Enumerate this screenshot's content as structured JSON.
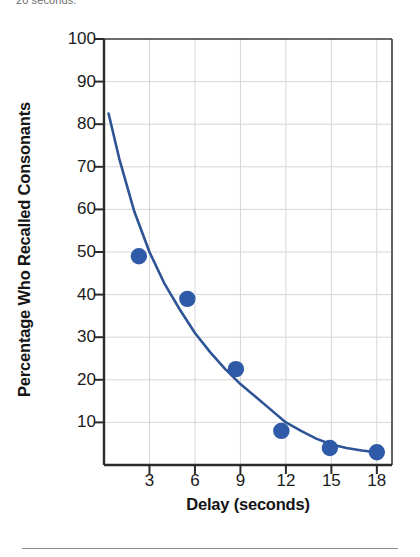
{
  "caption": {
    "text": "20 seconds."
  },
  "chart_data": {
    "type": "scatter",
    "title": "",
    "xlabel": "Delay (seconds)",
    "ylabel": "Percentage Who Recalled Consonants",
    "xlim": [
      0,
      19
    ],
    "ylim": [
      0,
      100
    ],
    "xticks": [
      "3",
      "6",
      "9",
      "12",
      "15",
      "18"
    ],
    "xtick_values": [
      3,
      6,
      9,
      12,
      15,
      18
    ],
    "yticks": [
      "10",
      "20",
      "30",
      "40",
      "50",
      "60",
      "70",
      "80",
      "90",
      "100"
    ],
    "ytick_values": [
      10,
      20,
      30,
      40,
      50,
      60,
      70,
      80,
      90,
      100
    ],
    "grid": true,
    "legend": "none",
    "marker_color": "#2e5aa8",
    "line_color": "#2f5496",
    "grid_color": "#d6d6d6",
    "axis_color": "#3a3a3a",
    "points": [
      {
        "x": 2.3,
        "y": 49.0
      },
      {
        "x": 5.5,
        "y": 39.0
      },
      {
        "x": 8.7,
        "y": 22.5
      },
      {
        "x": 11.7,
        "y": 8.0
      },
      {
        "x": 14.9,
        "y": 4.0
      },
      {
        "x": 18.0,
        "y": 3.0
      }
    ],
    "curve": [
      {
        "x": 0.3,
        "y": 82.5
      },
      {
        "x": 1.0,
        "y": 72.0
      },
      {
        "x": 2.0,
        "y": 59.5
      },
      {
        "x": 3.0,
        "y": 50.0
      },
      {
        "x": 4.0,
        "y": 42.5
      },
      {
        "x": 5.0,
        "y": 36.5
      },
      {
        "x": 6.0,
        "y": 31.0
      },
      {
        "x": 7.0,
        "y": 26.5
      },
      {
        "x": 8.0,
        "y": 22.5
      },
      {
        "x": 9.0,
        "y": 19.0
      },
      {
        "x": 10.0,
        "y": 16.0
      },
      {
        "x": 11.0,
        "y": 13.0
      },
      {
        "x": 12.0,
        "y": 10.0
      },
      {
        "x": 13.0,
        "y": 8.0
      },
      {
        "x": 14.0,
        "y": 6.2
      },
      {
        "x": 15.0,
        "y": 4.8
      },
      {
        "x": 16.0,
        "y": 4.0
      },
      {
        "x": 17.0,
        "y": 3.4
      },
      {
        "x": 18.0,
        "y": 3.0
      }
    ]
  }
}
